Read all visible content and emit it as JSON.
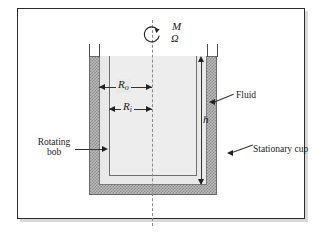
{
  "figure": {
    "name": "concentric-cylinder-viscometer",
    "background": "#ffffff",
    "frame_color": "#2b2b2b"
  },
  "labels": {
    "torque": "M",
    "angular_velocity": "Ω",
    "radius_outer": "R",
    "radius_outer_sub": "o",
    "radius_inner": "R",
    "radius_inner_sub": "i",
    "height": "h",
    "fluid": "Fluid",
    "stationary_cup": "Stationary cup",
    "rotating_bob_line1": "Rotating",
    "rotating_bob_line2": "bob"
  },
  "colors": {
    "cup_fill": "#b8b8b8",
    "cup_hatch": "#8d8d8d",
    "fluid_fill": "#e9e9e9",
    "bob_fill": "#ededed",
    "line": "#333333",
    "centerline": "#8a8a8a"
  },
  "geometry": {
    "cup_outer_left": 89,
    "cup_outer_top": 56,
    "cup_outer_width": 128,
    "cup_outer_height": 139,
    "wall_thickness": 10,
    "bob_left": 109,
    "bob_width": 88,
    "bob_height": 120,
    "axis_x": 152
  }
}
